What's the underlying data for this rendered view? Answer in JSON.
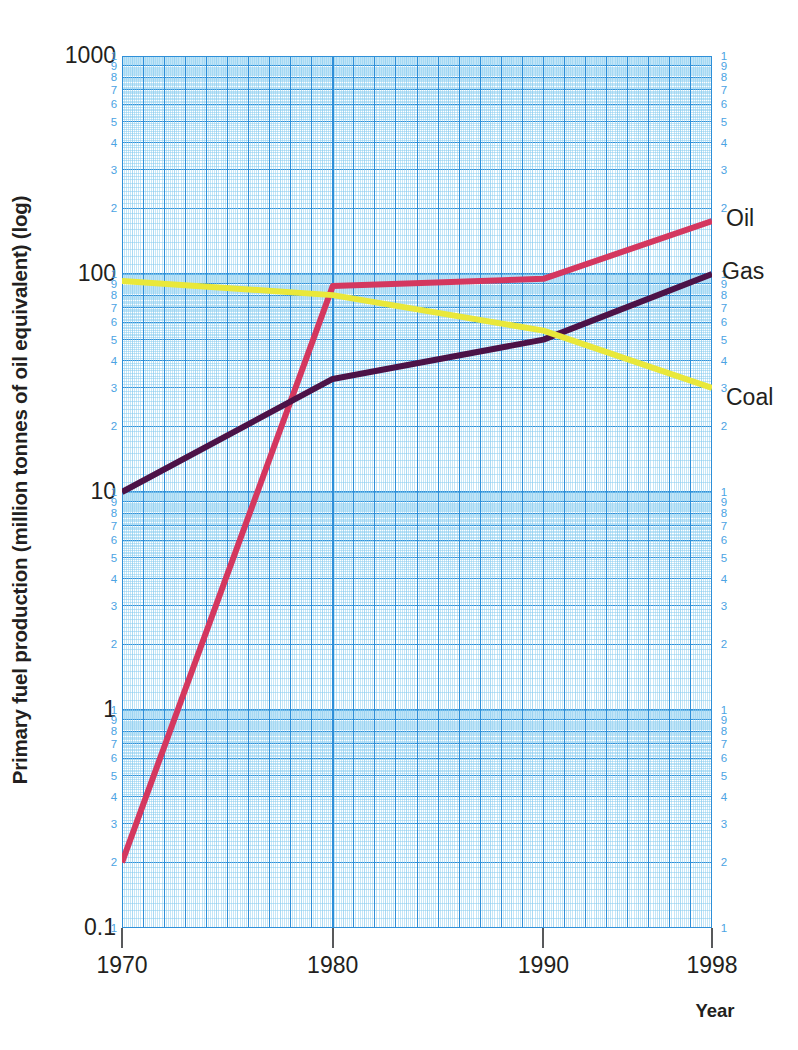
{
  "chart_data": {
    "type": "line",
    "title": "",
    "xlabel": "Year",
    "ylabel": "Primary fuel production (million tonnes of oil equivalent) (log)",
    "yscale": "log",
    "ylim": [
      0.1,
      1000
    ],
    "xlim": [
      1970,
      1998
    ],
    "grid": true,
    "grid_style": "log-log graph paper (blue)",
    "legend_position": "right-of-axis series end labels",
    "y_decade_ticks": [
      "1000",
      "100",
      "10",
      "1",
      "0.1"
    ],
    "y_minor_tick_labels": [
      "1",
      "9",
      "8",
      "7",
      "6",
      "5",
      "4",
      "3",
      "2"
    ],
    "x_ticks": [
      "1970",
      "1980",
      "1990",
      "1998"
    ],
    "series": [
      {
        "name": "Oil",
        "color": "#d4375f",
        "x": [
          1970,
          1980,
          1990,
          1998
        ],
        "values": [
          0.2,
          88,
          95,
          175
        ]
      },
      {
        "name": "Gas",
        "color": "#4c1247",
        "x": [
          1970,
          1980,
          1990,
          1998
        ],
        "values": [
          10,
          33,
          50,
          100
        ]
      },
      {
        "name": "Coal",
        "color": "#e9e83a",
        "x": [
          1970,
          1980,
          1990,
          1998
        ],
        "values": [
          93,
          80,
          55,
          30
        ]
      }
    ]
  },
  "axes": {
    "y_title": "Primary fuel production (million tonnes of oil equivalent) (log)",
    "x_title": "Year"
  },
  "labels": {
    "oil": "Oil",
    "gas": "Gas",
    "coal": "Coal"
  },
  "colors": {
    "oil": "#d4375f",
    "gas": "#4c1247",
    "coal": "#e9e83a",
    "grid_major": "#2e8fd8",
    "grid_minor": "#8ccdf0",
    "tick_text": "#4ba3e3",
    "axis_text": "#231f20"
  }
}
